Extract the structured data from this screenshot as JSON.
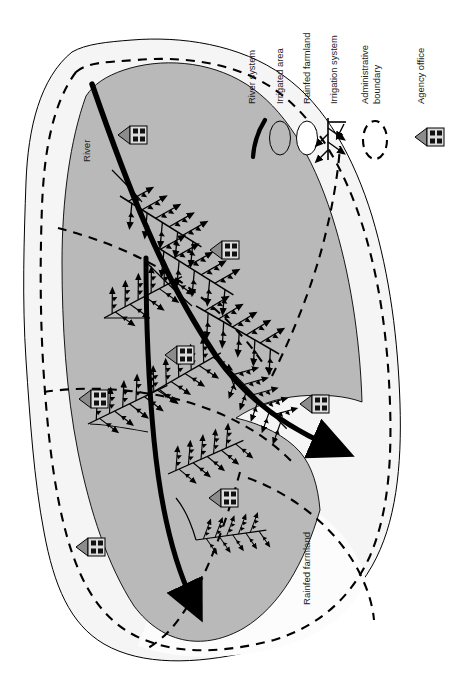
{
  "figure": {
    "width": 460,
    "height": 677,
    "background": "#ffffff"
  },
  "colors": {
    "irrigated_fill": "#b9b9b9",
    "rainfed_fill": "#fbfbfb",
    "outer_fill": "#f4f4f4",
    "stroke": "#000000",
    "office_triangle": "#8c8c8c",
    "office_body": "#d8d8d8",
    "text": "#1a1a1a"
  },
  "legend": {
    "orientation": "vertical-rotated-90",
    "items": [
      {
        "label": "River system",
        "icon": "river-curve-icon",
        "key": "river_system"
      },
      {
        "label": "Irrigated area",
        "icon": "gray-ellipse-icon",
        "key": "irrigated_area"
      },
      {
        "label": "Rainfed farmland",
        "icon": "white-ellipse-icon",
        "key": "rainfed_farmland"
      },
      {
        "label": "Irrigation system",
        "icon": "canal-branch-icon",
        "key": "irrigation_system"
      },
      {
        "label": "Administrative boundary",
        "label_line1": "Administrative",
        "label_line2": "boundary",
        "icon": "dashed-ellipse-icon",
        "key": "admin_boundary"
      },
      {
        "label": "Agency office",
        "icon": "agency-office-icon",
        "key": "agency_office"
      }
    ]
  },
  "map_labels": [
    {
      "text": "River",
      "key": "river",
      "rotation": -90
    },
    {
      "text": "Rainfed farmland",
      "key": "rainfed-farmland",
      "rotation": -90
    }
  ],
  "map_features": {
    "agency_office_count": 6,
    "river_branch_count": 2,
    "river_outlets": 2,
    "admin_zone_count": 5,
    "canal_system_count": 6
  }
}
